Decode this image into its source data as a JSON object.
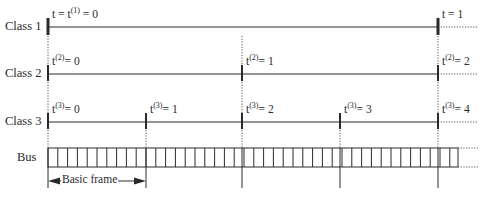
{
  "diagram": {
    "type": "timing-diagram",
    "colors": {
      "line": "#2a2a2a",
      "dotted": "#555555",
      "background": "#ffffff"
    },
    "rows": [
      {
        "id": "class1",
        "label": "Class 1",
        "y": 27
      },
      {
        "id": "class2",
        "label": "Class 2",
        "y": 74
      },
      {
        "id": "class3",
        "label": "Class 3",
        "y": 122
      },
      {
        "id": "bus",
        "label": "Bus",
        "y": 148
      }
    ],
    "class1": {
      "label": "Class 1",
      "marks": [
        {
          "x": 48,
          "text_main": "t = t",
          "sup": "(1)",
          "text_tail": " = 0"
        },
        {
          "x": 438,
          "text_main": "t  = 1",
          "sup": "",
          "text_tail": ""
        }
      ]
    },
    "class2": {
      "label": "Class 2",
      "marks": [
        {
          "x": 48,
          "text_main": "t",
          "sup": "(2)",
          "text_tail": "= 0"
        },
        {
          "x": 242,
          "text_main": "t",
          "sup": "(2)",
          "text_tail": "= 1"
        },
        {
          "x": 438,
          "text_main": "t",
          "sup": "(2)",
          "text_tail": "= 2"
        }
      ]
    },
    "class3": {
      "label": "Class 3",
      "marks": [
        {
          "x": 48,
          "text_main": "t",
          "sup": "(3)",
          "text_tail": "= 0"
        },
        {
          "x": 146,
          "text_main": "t",
          "sup": "(3)",
          "text_tail": "= 1"
        },
        {
          "x": 242,
          "text_main": "t",
          "sup": "(3)",
          "text_tail": "= 2"
        },
        {
          "x": 340,
          "text_main": "t",
          "sup": "(3)",
          "text_tail": "= 3"
        },
        {
          "x": 438,
          "text_main": "t",
          "sup": "(3)",
          "text_tail": "= 4"
        }
      ]
    },
    "bus": {
      "label": "Bus",
      "x_start": 48,
      "x_end": 458,
      "top": 148,
      "bottom": 167,
      "cell_count": 42,
      "cells_per_basic_frame": 10
    },
    "basic_frame": {
      "label": "Basic frame",
      "x_start": 48,
      "x_end": 146,
      "y": 181
    },
    "timeline": {
      "x_start": 48,
      "x_end": 438,
      "dotted_end": 478
    }
  }
}
